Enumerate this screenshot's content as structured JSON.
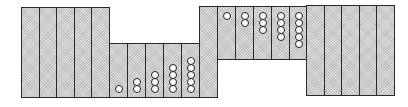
{
  "diagram": {
    "colors": {
      "stroke": "#2a2a2a",
      "fill": "#dcdcdc",
      "bead": "#ffffff"
    },
    "left_block": {
      "columns": 5,
      "beads": [
        0,
        0,
        0,
        0,
        0
      ]
    },
    "low_block": {
      "columns": 5,
      "beads": [
        1,
        2,
        3,
        4,
        5
      ]
    },
    "high_block": {
      "columns": 5,
      "beads": [
        1,
        2,
        3,
        4,
        5
      ]
    },
    "right_block": {
      "columns": 5,
      "beads": [
        0,
        0,
        0,
        0,
        0
      ]
    }
  }
}
